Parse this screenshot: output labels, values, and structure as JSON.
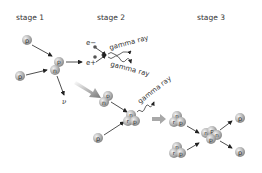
{
  "diagram": {
    "stages": [
      {
        "label": "stage 1",
        "x": 16,
        "y": 16
      },
      {
        "label": "stage 2",
        "x": 97,
        "y": 16
      },
      {
        "label": "stage 3",
        "x": 197,
        "y": 16
      }
    ],
    "particle_labels": {
      "proton": "p",
      "neutron": "n",
      "electron": "e−",
      "positron": "e+",
      "neutrino": "ν",
      "gamma": "gamma ray"
    },
    "gamma_labels": [
      "gamma ray",
      "gamma ray",
      "gamma ray"
    ],
    "colors": {
      "particle": "#b8b8b8",
      "particle_highlight": "#e8e8e8",
      "arrow": "#222222",
      "big_arrow": "#8a8a8a",
      "text": "#333333"
    }
  }
}
